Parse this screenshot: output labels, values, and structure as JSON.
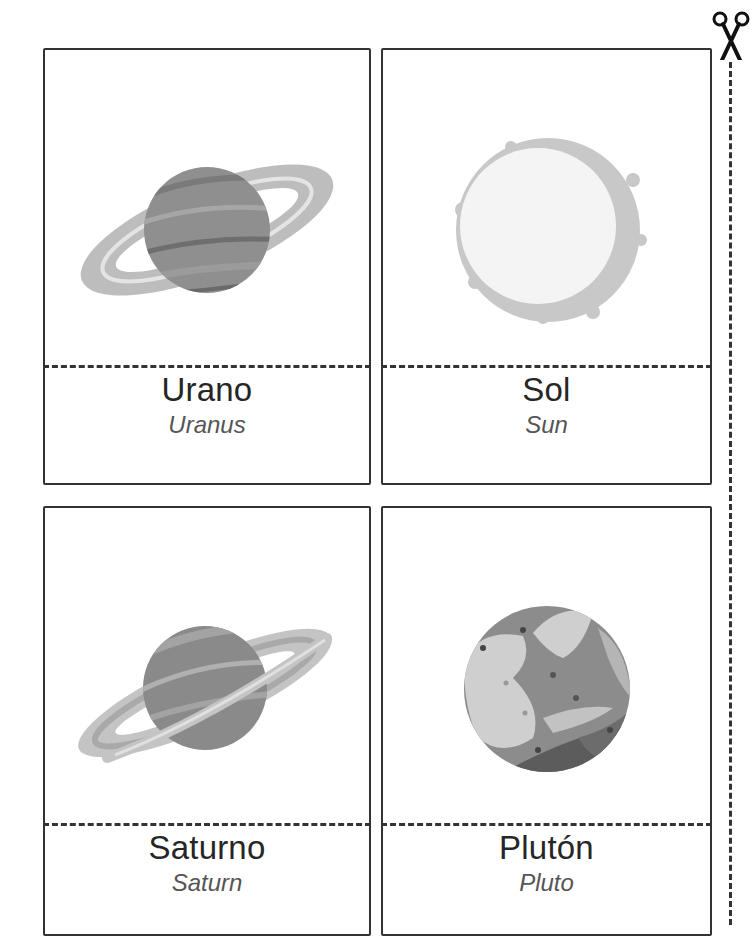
{
  "page": {
    "type": "printable-flashcards",
    "cut_guide": {
      "icon": "scissors-icon"
    }
  },
  "cards": [
    {
      "name_es": "Urano",
      "name_en": "Uranus",
      "illustration": "ringed-planet-icon"
    },
    {
      "name_es": "Sol",
      "name_en": "Sun",
      "illustration": "sun-icon"
    },
    {
      "name_es": "Saturno",
      "name_en": "Saturn",
      "illustration": "ringed-planet-icon"
    },
    {
      "name_es": "Plutón",
      "name_en": "Pluto",
      "illustration": "dwarf-planet-icon"
    }
  ],
  "colors": {
    "border": "#333333",
    "text_primary": "#262626",
    "text_secondary": "#555555",
    "planet_gray": "#8f8f8f",
    "ring_gray": "#bdbdbd",
    "sun_face": "#f4f4f4",
    "sun_corona": "#c8c8c8"
  }
}
